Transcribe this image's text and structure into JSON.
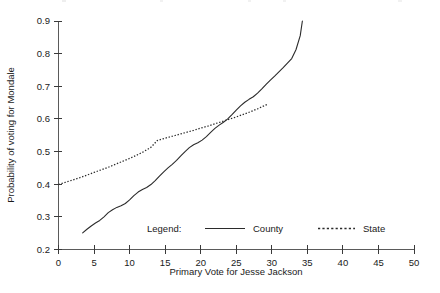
{
  "chart_data": {
    "type": "line",
    "title": "",
    "xlabel": "Primary Vote for Jesse Jackson",
    "ylabel": "Probability of voting for Mondale",
    "xlim": [
      0,
      50
    ],
    "ylim": [
      0.2,
      0.9
    ],
    "xticks": [
      0,
      5,
      10,
      15,
      20,
      25,
      30,
      35,
      40,
      45,
      50
    ],
    "xtick_labels": [
      "0",
      "5",
      "10",
      "15",
      "20",
      "25",
      "30",
      "35",
      "40",
      "45",
      "50"
    ],
    "yticks": [
      0.2,
      0.3,
      0.4,
      0.5,
      0.6,
      0.7,
      0.8,
      0.9
    ],
    "ytick_labels": [
      "0.2",
      "0.3",
      "0.4",
      "0.5",
      "0.6",
      "0.7",
      "0.8",
      "0.9"
    ],
    "grid": false,
    "legend_position": "inside-bottom-center",
    "legend_title": "Legend:",
    "series": [
      {
        "name": "County",
        "style": "solid",
        "color": "#2b2b2b",
        "x": [
          3.4,
          4.0,
          4.6,
          5.2,
          5.8,
          6.4,
          7.0,
          7.6,
          8.2,
          8.8,
          9.4,
          10.0,
          10.6,
          11.2,
          11.8,
          12.4,
          13.0,
          13.6,
          14.2,
          14.8,
          15.4,
          16.0,
          16.6,
          17.2,
          17.8,
          18.4,
          19.0,
          19.6,
          20.2,
          20.8,
          21.4,
          22.0,
          22.6,
          23.2,
          23.8,
          24.4,
          25.0,
          25.6,
          26.2,
          26.8,
          27.4,
          28.0,
          28.6,
          29.2,
          29.8,
          30.4,
          31.0,
          31.6,
          32.2,
          32.8,
          33.4,
          34.0,
          34.3
        ],
        "y": [
          0.251,
          0.262,
          0.272,
          0.281,
          0.289,
          0.3,
          0.313,
          0.322,
          0.329,
          0.334,
          0.341,
          0.352,
          0.365,
          0.376,
          0.384,
          0.39,
          0.399,
          0.411,
          0.425,
          0.438,
          0.45,
          0.461,
          0.473,
          0.487,
          0.5,
          0.512,
          0.521,
          0.527,
          0.535,
          0.546,
          0.559,
          0.571,
          0.581,
          0.59,
          0.6,
          0.613,
          0.627,
          0.64,
          0.651,
          0.66,
          0.668,
          0.679,
          0.692,
          0.706,
          0.719,
          0.731,
          0.744,
          0.757,
          0.771,
          0.785,
          0.812,
          0.855,
          0.9
        ]
      },
      {
        "name": "State",
        "style": "dotted",
        "color": "#2b2b2b",
        "x": [
          0.0,
          1.0,
          2.0,
          3.0,
          4.0,
          5.0,
          6.0,
          7.0,
          8.0,
          9.0,
          10.0,
          11.0,
          12.0,
          13.0,
          13.9,
          15.0,
          16.0,
          17.0,
          18.0,
          19.0,
          20.0,
          21.0,
          22.0,
          23.0,
          24.0,
          25.0,
          26.0,
          27.0,
          28.0,
          29.0,
          29.4
        ],
        "y": [
          0.399,
          0.406,
          0.413,
          0.42,
          0.428,
          0.436,
          0.444,
          0.452,
          0.461,
          0.47,
          0.479,
          0.489,
          0.5,
          0.513,
          0.534,
          0.541,
          0.547,
          0.553,
          0.559,
          0.565,
          0.572,
          0.578,
          0.585,
          0.592,
          0.599,
          0.606,
          0.614,
          0.622,
          0.631,
          0.641,
          0.645
        ]
      }
    ]
  },
  "legend": {
    "title": "Legend:",
    "entries": [
      {
        "label": "County",
        "style": "solid"
      },
      {
        "label": "State",
        "style": "dotted"
      }
    ]
  },
  "axes": {
    "x_title": "Primary Vote for Jesse Jackson",
    "y_title": "Probability of voting for Mondale"
  }
}
